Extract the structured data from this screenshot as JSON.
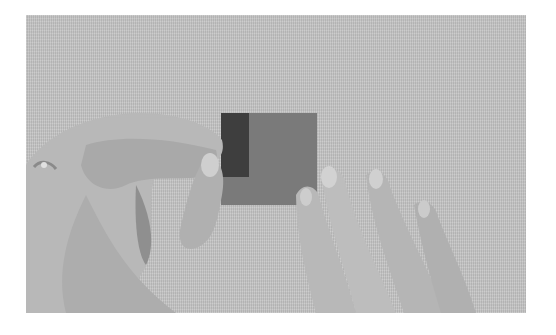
{
  "image": {
    "description": "Black-and-white photograph of two hands folding a small square of paper on a textured surface",
    "alt": "Hands folding a square piece of paper",
    "colors": {
      "border": "#ffffff",
      "background_surface": "#c4c4c4",
      "paper_light": "#7a7a7a",
      "paper_dark_flap": "#3e3e3e",
      "skin": "#b8b8b8",
      "skin_shadow": "#8f8f8f"
    }
  }
}
